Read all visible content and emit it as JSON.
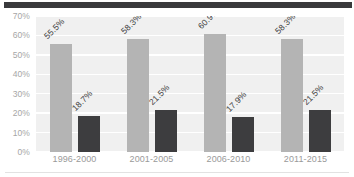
{
  "chart_data": {
    "type": "bar",
    "title": "",
    "subtitle": "",
    "xlabel": "",
    "ylabel": "",
    "categories": [
      "1996-2000",
      "2001-2005",
      "2006-2010",
      "2011-2015"
    ],
    "series": [
      {
        "name": "series-light",
        "color": "#b4b4b4",
        "values": [
          55.5,
          58.3,
          60.9,
          58.3
        ],
        "labels": [
          "55.5%",
          "58.3%",
          "60.9%",
          "58.3%"
        ]
      },
      {
        "name": "series-dark",
        "color": "#3d3d3f",
        "values": [
          18.7,
          21.5,
          17.9,
          21.5
        ],
        "labels": [
          "18.7%",
          "21.5%",
          "17.9%",
          "21.5%"
        ]
      }
    ],
    "ylim": [
      0,
      70
    ],
    "yticks": [
      0,
      10,
      20,
      30,
      40,
      50,
      60,
      70
    ],
    "ytick_labels": [
      "0%",
      "10%",
      "20%",
      "30%",
      "40%",
      "50%",
      "60%",
      "70%"
    ],
    "grid": true,
    "grid_orientation": "horizontal",
    "legend": false,
    "legend_position": "none",
    "data_label_rotation": -45,
    "plot_background": "#f0f0f0",
    "gridline_color": "#ffffff",
    "tick_label_color": "#9a9a9a",
    "data_label_color": "#3c3c3c"
  },
  "decor": {
    "top_band_color": "#3a3a3c",
    "bottom_rule_color": "#e2e2e2"
  }
}
